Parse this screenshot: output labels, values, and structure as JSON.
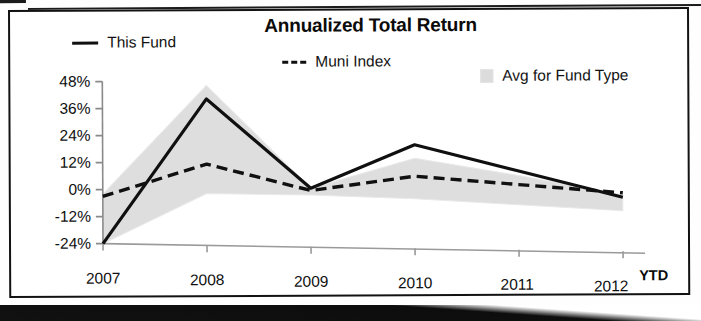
{
  "chart_data": {
    "type": "line",
    "title": "Annualized Total Return",
    "xlabel": "",
    "ylabel": "",
    "categories": [
      "2007",
      "2008",
      "2009",
      "2010",
      "2011",
      "2012"
    ],
    "x_axis_note": "YTD",
    "ylim": [
      -24,
      48
    ],
    "yticks": [
      48,
      36,
      24,
      12,
      0,
      -12,
      -24
    ],
    "ytick_labels": [
      "48%",
      "36%",
      "24%",
      "12%",
      "0%",
      "-12%",
      "-24%"
    ],
    "grid": false,
    "legend_position": "top",
    "series": [
      {
        "name": "This Fund",
        "style": "solid",
        "color": "#101010",
        "values": [
          -24,
          41,
          2,
          22,
          11,
          0
        ]
      },
      {
        "name": "Muni Index",
        "style": "dashed",
        "color": "#101010",
        "values": [
          -3,
          12,
          1,
          8,
          5,
          2
        ]
      },
      {
        "name": "Avg for Fund Type",
        "style": "band",
        "color": "#dcdcdc",
        "band_upper": [
          -2,
          47,
          2,
          16,
          9,
          1
        ],
        "band_lower": [
          -24,
          -1,
          -1,
          -2,
          -4,
          -6
        ]
      }
    ]
  },
  "chart": {
    "title": "Annualized Total Return",
    "legend": [
      {
        "label": "This Fund",
        "swatch": "solid-line-swatch"
      },
      {
        "label": "Muni Index",
        "swatch": "dashed-line-swatch"
      },
      {
        "label": "Avg for Fund Type",
        "swatch": "shaded-band-swatch"
      }
    ],
    "y_axis": {
      "ticks": [
        "48%",
        "36%",
        "24%",
        "12%",
        "0%",
        "-12%",
        "-24%"
      ]
    },
    "x_axis": {
      "ticks": [
        "2007",
        "2008",
        "2009",
        "2010",
        "2011",
        "2012"
      ],
      "suffix": "YTD"
    }
  },
  "colors": {
    "line": "#101010",
    "band": "#dcdcdc",
    "axis": "#6d6d6d",
    "frame": "#121212",
    "text": "#0b0b0b"
  }
}
